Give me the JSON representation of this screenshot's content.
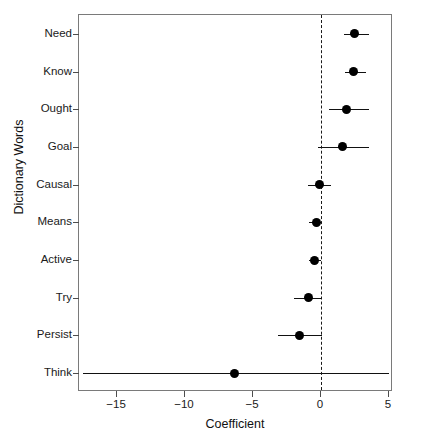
{
  "chart_data": {
    "type": "scatter",
    "subtype": "coefficient-plot-with-error-bars",
    "title": "",
    "xlabel": "Coefficient",
    "ylabel": "Dictionary Words",
    "xlim": [
      -17.8,
      5.3
    ],
    "xticks": [
      -15,
      -10,
      -5,
      0,
      5
    ],
    "xticklabels": [
      "−15",
      "−10",
      "−5",
      "0",
      "5"
    ],
    "grid": false,
    "legend": null,
    "reference_line": {
      "x": 0,
      "style": "dashed",
      "color": "#1a1a1a"
    },
    "categories": [
      "Need",
      "Know",
      "Ought",
      "Goal",
      "Causal",
      "Means",
      "Active",
      "Try",
      "Persist",
      "Think"
    ],
    "point_color": "#000000",
    "points": [
      {
        "label": "Need",
        "estimate": 2.5,
        "ci_low": 1.7,
        "ci_high": 3.55
      },
      {
        "label": "Know",
        "estimate": 2.4,
        "ci_low": 1.75,
        "ci_high": 3.35
      },
      {
        "label": "Ought",
        "estimate": 1.9,
        "ci_low": 0.6,
        "ci_high": 3.5
      },
      {
        "label": "Goal",
        "estimate": 1.55,
        "ci_low": -0.25,
        "ci_high": 3.5
      },
      {
        "label": "Causal",
        "estimate": -0.1,
        "ci_low": -0.95,
        "ci_high": 0.75
      },
      {
        "label": "Means",
        "estimate": -0.35,
        "ci_low": -0.85,
        "ci_high": 0.05
      },
      {
        "label": "Active",
        "estimate": -0.45,
        "ci_low": -0.9,
        "ci_high": 0.0
      },
      {
        "label": "Try",
        "estimate": -0.9,
        "ci_low": -2.0,
        "ci_high": 0.05
      },
      {
        "label": "Persist",
        "estimate": -1.55,
        "ci_low": -3.15,
        "ci_high": 0.05
      },
      {
        "label": "Think",
        "estimate": -6.35,
        "ci_low": -17.5,
        "ci_high": 5.0
      }
    ]
  },
  "axes": {
    "x_title": "Coefficient",
    "y_title": "Dictionary Words"
  }
}
